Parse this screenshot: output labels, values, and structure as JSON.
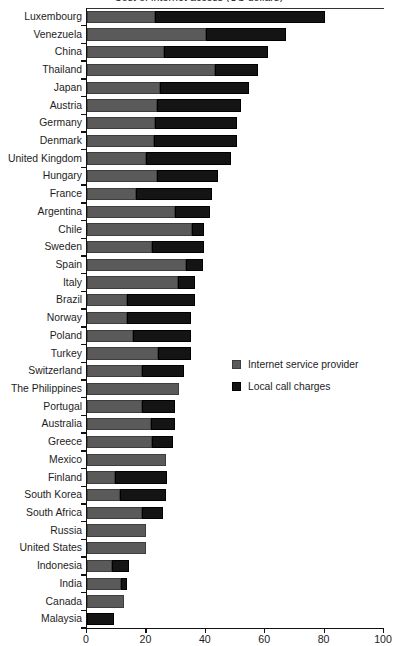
{
  "chart_data": {
    "type": "bar",
    "orientation": "horizontal",
    "stacked": true,
    "title": "Cost of internet access (US dollars)",
    "xlabel": "",
    "ylabel": "",
    "xlim": [
      0,
      100
    ],
    "xticks": [
      0,
      20,
      40,
      60,
      80,
      100
    ],
    "grid": false,
    "legend_position": "middle-right",
    "categories": [
      "Luxembourg",
      "Venezuela",
      "China",
      "Thailand",
      "Japan",
      "Austria",
      "Germany",
      "Denmark",
      "United Kingdom",
      "Hungary",
      "France",
      "Argentina",
      "Chile",
      "Sweden",
      "Spain",
      "Italy",
      "Brazil",
      "Norway",
      "Poland",
      "Turkey",
      "Switzerland",
      "The Philippines",
      "Portugal",
      "Australia",
      "Greece",
      "Mexico",
      "Finland",
      "South Korea",
      "South Africa",
      "Russia",
      "United States",
      "Indonesia",
      "India",
      "Canada",
      "Malaysia"
    ],
    "series": [
      {
        "name": "Internet service provider",
        "color": "#5a5a5a",
        "values": [
          23.0,
          40.0,
          26.0,
          43.0,
          24.5,
          23.5,
          23.0,
          22.5,
          20.0,
          23.5,
          16.5,
          29.5,
          35.5,
          22.0,
          33.5,
          30.5,
          13.5,
          13.5,
          15.5,
          24.0,
          18.5,
          31.0,
          18.5,
          21.5,
          22.0,
          26.5,
          9.5,
          11.0,
          18.5,
          20.0,
          20.0,
          8.5,
          11.5,
          12.5,
          0.0
        ]
      },
      {
        "name": "Local call charges",
        "color": "#141414",
        "values": [
          57.0,
          27.0,
          35.0,
          14.5,
          30.0,
          28.5,
          27.5,
          28.0,
          28.5,
          20.5,
          25.5,
          12.0,
          4.0,
          17.5,
          5.5,
          6.0,
          23.0,
          21.5,
          19.5,
          11.0,
          14.0,
          0.0,
          11.0,
          8.0,
          7.0,
          0.0,
          17.5,
          15.5,
          7.0,
          0.0,
          0.0,
          5.5,
          2.0,
          0.0,
          9.0
        ]
      }
    ],
    "totals": [
      80.0,
      67.0,
      61.0,
      57.5,
      54.5,
      52.0,
      50.5,
      50.5,
      48.5,
      44.0,
      42.0,
      41.5,
      39.5,
      39.5,
      39.0,
      36.5,
      36.5,
      35.0,
      35.0,
      35.0,
      32.5,
      31.0,
      29.5,
      29.5,
      29.0,
      26.5,
      27.0,
      26.5,
      25.5,
      20.0,
      20.0,
      14.0,
      13.5,
      12.5,
      9.0
    ]
  },
  "legend": {
    "items": [
      {
        "label": "Internet service provider",
        "color": "#5a5a5a"
      },
      {
        "label": "Local call charges",
        "color": "#141414"
      }
    ]
  },
  "axis": {
    "tick_labels": [
      "0",
      "20",
      "40",
      "60",
      "80",
      "100"
    ]
  }
}
